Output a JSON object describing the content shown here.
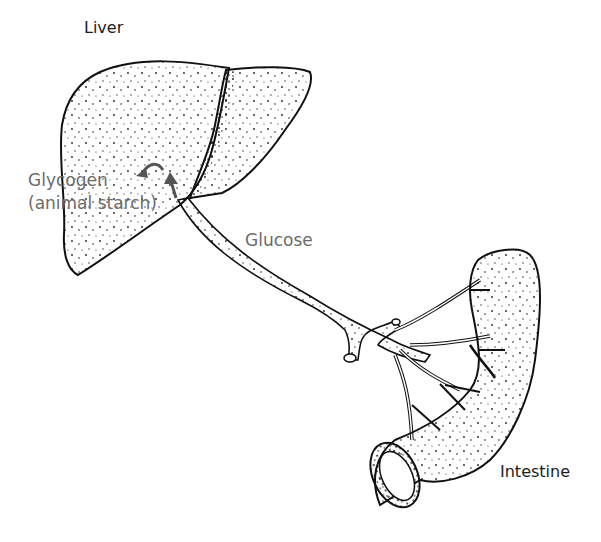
{
  "diagram": {
    "type": "anatomical-illustration",
    "labels": {
      "liver": "Liver",
      "glycogen": "Glycogen",
      "glycogen_note": "(animal starch)",
      "glucose": "Glucose",
      "intestine": "Intestine"
    },
    "nodes": [
      {
        "id": "intestine",
        "label": "Intestine"
      },
      {
        "id": "liver",
        "label": "Liver"
      },
      {
        "id": "glycogen",
        "label": "Glycogen (animal starch)"
      }
    ],
    "edges": [
      {
        "from": "intestine",
        "to": "liver",
        "label": "Glucose",
        "via": "portal vein"
      },
      {
        "from": "liver",
        "to": "glycogen",
        "label": ""
      }
    ],
    "colors": {
      "line": "#111111",
      "stipple": "#222222",
      "label_dark": "#1c1c1c",
      "label_gray": "#6b6b6b",
      "arrow": "#555555",
      "background": "#ffffff"
    }
  }
}
